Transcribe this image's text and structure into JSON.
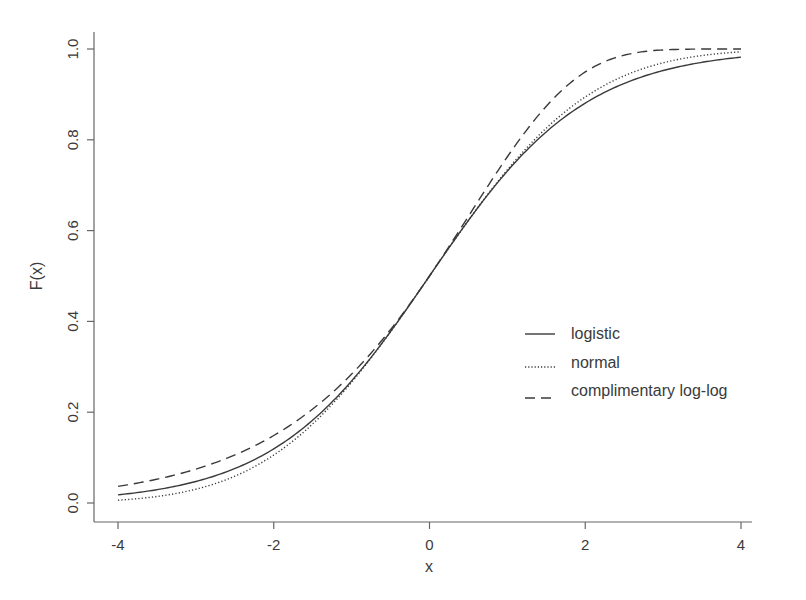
{
  "chart_data": {
    "type": "line",
    "title": "",
    "xlabel": "x",
    "ylabel": "F(x)",
    "xlim": [
      -4,
      4
    ],
    "ylim": [
      0,
      1
    ],
    "x_ticks": [
      "-4",
      "-2",
      "0",
      "2",
      "4"
    ],
    "y_ticks": [
      "0.0",
      "0.2",
      "0.4",
      "0.6",
      "0.8",
      "1.0"
    ],
    "grid": false,
    "legend_position": "center-right",
    "x": [
      -4,
      -3,
      -2,
      -1,
      0,
      1,
      2,
      3,
      4
    ],
    "series": [
      {
        "name": "logistic",
        "style": "solid",
        "values": [
          0.018,
          0.047,
          0.119,
          0.269,
          0.5,
          0.731,
          0.881,
          0.953,
          0.982
        ]
      },
      {
        "name": "normal",
        "style": "dotted",
        "values": [
          0.006,
          0.03,
          0.106,
          0.266,
          0.5,
          0.734,
          0.894,
          0.97,
          0.994
        ]
      },
      {
        "name": "complimentary log-log",
        "style": "dashed",
        "values": [
          0.037,
          0.073,
          0.141,
          0.264,
          0.5,
          0.78,
          0.961,
          0.999,
          1.0
        ]
      }
    ]
  },
  "legend": {
    "items": [
      {
        "label": "logistic"
      },
      {
        "label": "normal"
      },
      {
        "label": "complimentary log-log"
      }
    ]
  },
  "colors": {
    "line": "#3a3a3a",
    "axis": "#555555",
    "text": "#3a3a3a"
  }
}
